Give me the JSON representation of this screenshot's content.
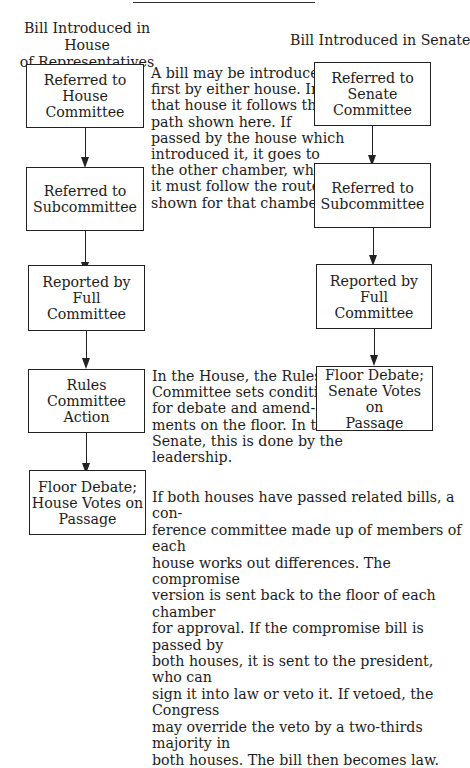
{
  "diagram": {
    "house_column": {
      "heading": "Bill Introduced in House\nof Representatives",
      "steps": [
        "Referred to House\nCommittee",
        "Referred to\nSubcommittee",
        "Reported by Full\nCommittee",
        "Rules Committee\nAction",
        "Floor Debate;\nHouse Votes on\nPassage"
      ]
    },
    "senate_column": {
      "heading": "Bill Introduced in Senate",
      "steps": [
        "Referred to\nSenate\nCommittee",
        "Referred to\nSubcommittee",
        "Reported by Full\nCommittee",
        "Floor Debate;\nSenate Votes on\nPassage"
      ]
    },
    "notes": {
      "introduction": "A bill may be introduced\nfirst by either house. In\nthat house it follows the\npath shown here. If\npassed by the house which\nintroduced it, it goes to\nthe other chamber, where\nit must follow the route\nshown for that chamber.",
      "rules": "In the House, the Rules\nCommittee sets conditions\nfor debate and amend-\nments on the floor. In the\nSenate, this is done by the\nleadership.",
      "conference": "If both houses have passed related bills, a con-\nference committee made up of members of each\nhouse works out differences. The compromise\nversion is sent back to the floor of each chamber\nfor approval. If the compromise bill is passed by\nboth houses, it is sent to the president, who can\nsign it into law or veto it. If vetoed, the Congress\nmay override the veto by a two-thirds majority in\nboth houses. The bill then becomes law."
    },
    "colors": {
      "line": "#222222",
      "text": "#1c1c1c",
      "background": "#ffffff"
    }
  }
}
